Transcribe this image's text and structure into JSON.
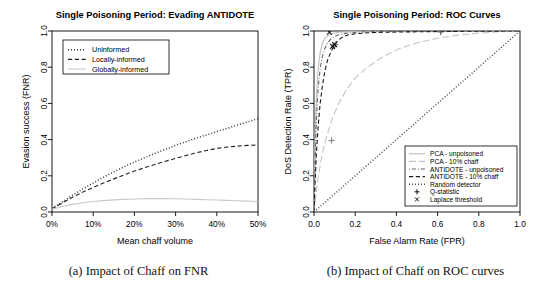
{
  "figure": {
    "panels": [
      {
        "id": "fnr-panel",
        "caption": "(a) Impact of Chaff on FNR"
      },
      {
        "id": "roc-panel",
        "caption": "(b) Impact of Chaff on ROC curves"
      }
    ]
  },
  "chart_data": [
    {
      "type": "line",
      "id": "evading-antidote",
      "title": "Single Poisoning Period: Evading ANTIDOTE",
      "xlabel": "Mean chaff volume",
      "ylabel": "Evasion success (FNR)",
      "xlim": [
        0,
        50
      ],
      "ylim": [
        0,
        1.0
      ],
      "xticks": [
        0,
        10,
        20,
        30,
        40,
        50
      ],
      "xticklabels": [
        "0%",
        "10%",
        "20%",
        "30%",
        "40%",
        "50%"
      ],
      "yticks": [
        0.0,
        0.2,
        0.4,
        0.6,
        0.8,
        1.0
      ],
      "yticklabels": [
        "0.0",
        "0.2",
        "0.4",
        "0.6",
        "0.8",
        "1.0"
      ],
      "grid": false,
      "legend_position": "top-left",
      "x": [
        0,
        2.5,
        5,
        7.5,
        10,
        12.5,
        15,
        17.5,
        20,
        22.5,
        25,
        27.5,
        30,
        32.5,
        35,
        37.5,
        40,
        42.5,
        45,
        47.5,
        50
      ],
      "series": [
        {
          "name": "Uninformed",
          "dash": "dotted",
          "color": "#222222",
          "values": [
            0.018,
            0.055,
            0.093,
            0.128,
            0.16,
            0.192,
            0.222,
            0.25,
            0.276,
            0.3,
            0.324,
            0.346,
            0.368,
            0.388,
            0.408,
            0.426,
            0.444,
            0.462,
            0.48,
            0.498,
            0.515
          ]
        },
        {
          "name": "Locally-informed",
          "dash": "dashed",
          "color": "#222222",
          "values": [
            0.018,
            0.05,
            0.082,
            0.11,
            0.136,
            0.16,
            0.183,
            0.205,
            0.226,
            0.245,
            0.263,
            0.28,
            0.296,
            0.312,
            0.327,
            0.34,
            0.351,
            0.359,
            0.364,
            0.368,
            0.37
          ]
        },
        {
          "name": "Globally-informed",
          "dash": "solid",
          "color": "#c9c9c9",
          "values": [
            0.016,
            0.03,
            0.042,
            0.051,
            0.058,
            0.063,
            0.067,
            0.07,
            0.072,
            0.074,
            0.074,
            0.074,
            0.073,
            0.072,
            0.07,
            0.068,
            0.066,
            0.064,
            0.062,
            0.06,
            0.058
          ]
        }
      ]
    },
    {
      "type": "line",
      "id": "roc-curves",
      "title": "Single Poisoning Period: ROC Curves",
      "xlabel": "False Alarm Rate (FPR)",
      "ylabel": "DoS Detection Rate (TPR)",
      "xlim": [
        0,
        1.0
      ],
      "ylim": [
        0,
        1.0
      ],
      "xticks": [
        0.0,
        0.2,
        0.4,
        0.6,
        0.8,
        1.0
      ],
      "xticklabels": [
        "0.0",
        "0.2",
        "0.4",
        "0.6",
        "0.8",
        "1.0"
      ],
      "yticks": [
        0.0,
        0.2,
        0.4,
        0.6,
        0.8,
        1.0
      ],
      "yticklabels": [
        "0.0",
        "0.2",
        "0.4",
        "0.6",
        "0.8",
        "1.0"
      ],
      "grid": false,
      "legend_position": "bottom-right",
      "series": [
        {
          "name": "PCA - unpoisoned",
          "dash": "solid",
          "color": "#bdbdbd",
          "points": [
            [
              0.0,
              0.0
            ],
            [
              0.004,
              0.3
            ],
            [
              0.008,
              0.52
            ],
            [
              0.013,
              0.66
            ],
            [
              0.018,
              0.76
            ],
            [
              0.024,
              0.83
            ],
            [
              0.03,
              0.88
            ],
            [
              0.038,
              0.92
            ],
            [
              0.048,
              0.95
            ],
            [
              0.06,
              0.968
            ],
            [
              0.075,
              0.98
            ],
            [
              0.095,
              0.988
            ],
            [
              0.12,
              0.993
            ],
            [
              0.16,
              0.996
            ],
            [
              0.22,
              0.998
            ],
            [
              0.32,
              0.999
            ],
            [
              0.5,
              1.0
            ],
            [
              0.75,
              1.0
            ],
            [
              1.0,
              1.0
            ]
          ]
        },
        {
          "name": "PCA - 10% chaff",
          "dash": "longdash",
          "color": "#c4c4c4",
          "points": [
            [
              0.0,
              0.0
            ],
            [
              0.01,
              0.1
            ],
            [
              0.02,
              0.19
            ],
            [
              0.035,
              0.29
            ],
            [
              0.05,
              0.37
            ],
            [
              0.07,
              0.45
            ],
            [
              0.09,
              0.52
            ],
            [
              0.12,
              0.6
            ],
            [
              0.16,
              0.68
            ],
            [
              0.2,
              0.74
            ],
            [
              0.26,
              0.8
            ],
            [
              0.33,
              0.855
            ],
            [
              0.41,
              0.9
            ],
            [
              0.5,
              0.935
            ],
            [
              0.6,
              0.96
            ],
            [
              0.7,
              0.977
            ],
            [
              0.8,
              0.988
            ],
            [
              0.9,
              0.996
            ],
            [
              1.0,
              1.0
            ]
          ]
        },
        {
          "name": "ANTIDOTE - unpoisoned",
          "dash": "dotdash",
          "color": "#666666",
          "points": [
            [
              0.0,
              0.0
            ],
            [
              0.005,
              0.26
            ],
            [
              0.01,
              0.46
            ],
            [
              0.016,
              0.61
            ],
            [
              0.023,
              0.72
            ],
            [
              0.031,
              0.8
            ],
            [
              0.041,
              0.86
            ],
            [
              0.053,
              0.905
            ],
            [
              0.068,
              0.938
            ],
            [
              0.085,
              0.96
            ],
            [
              0.11,
              0.975
            ],
            [
              0.14,
              0.985
            ],
            [
              0.19,
              0.992
            ],
            [
              0.26,
              0.996
            ],
            [
              0.38,
              0.998
            ],
            [
              0.55,
              0.999
            ],
            [
              0.78,
              1.0
            ],
            [
              1.0,
              1.0
            ]
          ]
        },
        {
          "name": "ANTIDOTE - 10% chaff",
          "dash": "dashed",
          "color": "#1a1a1a",
          "points": [
            [
              0.0,
              0.0
            ],
            [
              0.006,
              0.18
            ],
            [
              0.012,
              0.33
            ],
            [
              0.02,
              0.47
            ],
            [
              0.029,
              0.59
            ],
            [
              0.04,
              0.69
            ],
            [
              0.052,
              0.775
            ],
            [
              0.066,
              0.84
            ],
            [
              0.082,
              0.885
            ],
            [
              0.1,
              0.925
            ],
            [
              0.118,
              0.95
            ],
            [
              0.14,
              0.968
            ],
            [
              0.165,
              0.978
            ],
            [
              0.2,
              0.985
            ],
            [
              0.26,
              0.99
            ],
            [
              0.34,
              0.993
            ],
            [
              0.45,
              0.995
            ],
            [
              0.6,
              0.997
            ],
            [
              0.8,
              0.999
            ],
            [
              1.0,
              1.0
            ]
          ]
        },
        {
          "name": "Random detector",
          "dash": "dotted",
          "color": "#3a3a3a",
          "points": [
            [
              0.0,
              0.0
            ],
            [
              1.0,
              1.0
            ]
          ]
        }
      ],
      "markers": [
        {
          "name": "Q-statistic",
          "symbol": "+",
          "color": "#888888",
          "points": [
            [
              0.085,
              0.395
            ],
            [
              0.097,
              0.915
            ],
            [
              0.103,
              0.925
            ]
          ]
        },
        {
          "name": "Q-statistic-far",
          "symbol": "+",
          "color": "#555555",
          "points": [
            [
              0.615,
              0.995
            ]
          ]
        },
        {
          "name": "Laplace threshold",
          "symbol": "x",
          "color": "#111111",
          "points": [
            [
              0.09,
              0.915
            ],
            [
              0.1,
              0.925
            ],
            [
              0.075,
              0.993
            ]
          ]
        }
      ],
      "legend": [
        {
          "label": "PCA - unpoisoned",
          "kind": "line",
          "dash": "solid",
          "color": "#bdbdbd"
        },
        {
          "label": "PCA - 10% chaff",
          "kind": "line",
          "dash": "longdash",
          "color": "#c4c4c4"
        },
        {
          "label": "ANTIDOTE - unpoisoned",
          "kind": "line",
          "dash": "dotdash",
          "color": "#666666"
        },
        {
          "label": "ANTIDOTE - 10% chaff",
          "kind": "line",
          "dash": "dashed",
          "color": "#1a1a1a"
        },
        {
          "label": "Random detector",
          "kind": "line",
          "dash": "dotted",
          "color": "#3a3a3a"
        },
        {
          "label": "Q-statistic",
          "kind": "marker",
          "symbol": "+",
          "color": "#111111"
        },
        {
          "label": "Laplace threshold",
          "kind": "marker",
          "symbol": "x",
          "color": "#111111"
        }
      ]
    }
  ]
}
